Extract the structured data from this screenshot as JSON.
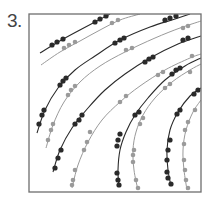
{
  "figure": {
    "panel_label": "3."
  },
  "colors": {
    "frame": "#6e6e6e",
    "dark_series": "#2a2a2a",
    "gray_series": "#9a9a9a",
    "background": "#ffffff"
  },
  "chart_data": {
    "type": "scatter",
    "title": "",
    "xlabel": "",
    "ylabel": "",
    "grid": false,
    "legend": "none",
    "frame": {
      "x": 29,
      "y": 14,
      "width": 172,
      "height": 178
    },
    "series": [
      {
        "name": "curve-1-dark",
        "tone": "dark",
        "path": [
          [
            40,
            53
          ],
          [
            58,
            42
          ],
          [
            78,
            31
          ],
          [
            95,
            22
          ],
          [
            110,
            14
          ]
        ],
        "markers": [
          [
            52,
            45
          ],
          [
            57,
            42
          ],
          [
            63,
            39
          ],
          [
            95,
            22
          ],
          [
            100,
            19
          ],
          [
            106,
            16
          ]
        ]
      },
      {
        "name": "curve-1-gray",
        "tone": "gray",
        "path": [
          [
            41,
            65
          ],
          [
            60,
            52
          ],
          [
            80,
            41
          ],
          [
            100,
            30
          ],
          [
            120,
            20
          ],
          [
            140,
            14
          ]
        ],
        "markers": [
          [
            64,
            48
          ],
          [
            69,
            45
          ],
          [
            75,
            42
          ],
          [
            112,
            23
          ],
          [
            118,
            20
          ]
        ]
      },
      {
        "name": "curve-2-dark",
        "tone": "dark",
        "path": [
          [
            37,
            133
          ],
          [
            45,
            110
          ],
          [
            58,
            88
          ],
          [
            75,
            70
          ],
          [
            95,
            56
          ],
          [
            120,
            40
          ],
          [
            150,
            27
          ],
          [
            175,
            19
          ],
          [
            190,
            14
          ]
        ],
        "markers": [
          [
            39,
            124
          ],
          [
            42,
            115
          ],
          [
            44,
            110
          ],
          [
            60,
            85
          ],
          [
            63,
            81
          ],
          [
            66,
            78
          ],
          [
            115,
            43
          ],
          [
            120,
            40
          ],
          [
            124,
            38
          ],
          [
            165,
            20
          ],
          [
            170,
            18
          ],
          [
            176,
            16
          ]
        ]
      },
      {
        "name": "curve-2-gray",
        "tone": "gray",
        "path": [
          [
            46,
            148
          ],
          [
            53,
            125
          ],
          [
            64,
            102
          ],
          [
            80,
            82
          ],
          [
            100,
            66
          ],
          [
            125,
            52
          ],
          [
            155,
            38
          ],
          [
            180,
            28
          ],
          [
            201,
            21
          ]
        ],
        "markers": [
          [
            48,
            140
          ],
          [
            51,
            130
          ],
          [
            53,
            124
          ],
          [
            68,
            95
          ],
          [
            71,
            90
          ],
          [
            75,
            86
          ],
          [
            126,
            50
          ],
          [
            132,
            48
          ],
          [
            183,
            28
          ],
          [
            188,
            26
          ]
        ]
      },
      {
        "name": "curve-3-dark",
        "tone": "dark",
        "path": [
          [
            53,
            172
          ],
          [
            60,
            150
          ],
          [
            72,
            128
          ],
          [
            88,
            108
          ],
          [
            105,
            90
          ],
          [
            125,
            74
          ],
          [
            150,
            58
          ],
          [
            178,
            44
          ],
          [
            201,
            36
          ]
        ],
        "markers": [
          [
            55,
            168
          ],
          [
            58,
            158
          ],
          [
            61,
            150
          ],
          [
            75,
            124
          ],
          [
            79,
            120
          ],
          [
            82,
            115
          ],
          [
            145,
            62
          ],
          [
            149,
            59
          ],
          [
            153,
            57
          ],
          [
            183,
            40
          ],
          [
            188,
            38
          ]
        ]
      },
      {
        "name": "curve-3-gray",
        "tone": "gray",
        "path": [
          [
            72,
            188
          ],
          [
            78,
            165
          ],
          [
            88,
            142
          ],
          [
            102,
            120
          ],
          [
            120,
            102
          ],
          [
            140,
            86
          ],
          [
            165,
            70
          ],
          [
            190,
            58
          ],
          [
            201,
            54
          ]
        ],
        "markers": [
          [
            72,
            185
          ],
          [
            73,
            180
          ],
          [
            75,
            170
          ],
          [
            84,
            150
          ],
          [
            87,
            142
          ],
          [
            90,
            132
          ],
          [
            120,
            102
          ],
          [
            126,
            96
          ],
          [
            158,
            75
          ],
          [
            163,
            72
          ],
          [
            192,
            56
          ]
        ]
      },
      {
        "name": "curve-4-dark",
        "tone": "dark",
        "path": [
          [
            119,
            187
          ],
          [
            118,
            170
          ],
          [
            120,
            150
          ],
          [
            126,
            132
          ],
          [
            135,
            115
          ],
          [
            148,
            98
          ],
          [
            165,
            80
          ],
          [
            185,
            66
          ],
          [
            201,
            58
          ]
        ],
        "markers": [
          [
            119,
            185
          ],
          [
            118,
            180
          ],
          [
            117,
            173
          ],
          [
            117,
            146
          ],
          [
            118,
            140
          ],
          [
            120,
            134
          ],
          [
            135,
            115
          ],
          [
            139,
            112
          ],
          [
            172,
            74
          ],
          [
            176,
            70
          ],
          [
            180,
            68
          ]
        ]
      },
      {
        "name": "curve-4-gray",
        "tone": "gray",
        "path": [
          [
            138,
            190
          ],
          [
            134,
            170
          ],
          [
            133,
            150
          ],
          [
            136,
            132
          ],
          [
            143,
            115
          ],
          [
            155,
            98
          ],
          [
            172,
            82
          ],
          [
            190,
            70
          ],
          [
            201,
            64
          ]
        ],
        "markers": [
          [
            138,
            188
          ],
          [
            136,
            180
          ],
          [
            133,
            162
          ],
          [
            133,
            155
          ],
          [
            134,
            150
          ],
          [
            140,
            124
          ],
          [
            143,
            118
          ],
          [
            165,
            88
          ],
          [
            170,
            84
          ],
          [
            190,
            72
          ]
        ]
      },
      {
        "name": "curve-5-dark",
        "tone": "dark",
        "path": [
          [
            171,
            186
          ],
          [
            168,
            170
          ],
          [
            167,
            150
          ],
          [
            170,
            130
          ],
          [
            178,
            112
          ],
          [
            190,
            96
          ],
          [
            201,
            88
          ]
        ],
        "markers": [
          [
            171,
            184
          ],
          [
            168,
            178
          ],
          [
            167,
            172
          ],
          [
            167,
            160
          ],
          [
            168,
            150
          ],
          [
            170,
            140
          ],
          [
            177,
            114
          ],
          [
            180,
            110
          ],
          [
            194,
            94
          ],
          [
            198,
            90
          ]
        ]
      },
      {
        "name": "curve-5-gray",
        "tone": "gray",
        "path": [
          [
            187,
            190
          ],
          [
            184,
            170
          ],
          [
            183,
            150
          ],
          [
            186,
            130
          ],
          [
            193,
            112
          ],
          [
            201,
            100
          ]
        ],
        "markers": [
          [
            188,
            188
          ],
          [
            186,
            180
          ],
          [
            185,
            170
          ],
          [
            184,
            160
          ],
          [
            184,
            144
          ],
          [
            185,
            130
          ],
          [
            188,
            122
          ],
          [
            195,
            110
          ]
        ]
      }
    ]
  }
}
